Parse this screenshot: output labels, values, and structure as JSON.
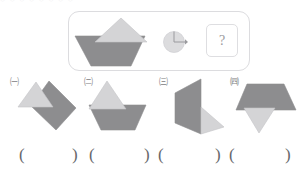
{
  "page": {
    "background_color": "#ffffff",
    "top_ghost_text": "○  ○   ○  ○  ○  ○   ○  ○"
  },
  "palette": {
    "shape_dark": "#8d8d8f",
    "shape_light": "#d4d4d6",
    "shape_mid": "#adadb0",
    "outline": "#9d9da0",
    "panel_border": "#dcdcdf",
    "text": "#6b6b6f"
  },
  "stimulus": {
    "panel_name": "question-panel",
    "source_figure": {
      "name": "source-figure",
      "description": "dark trapezoid with light triangle on its upper right",
      "parts": [
        {
          "shape": "trapezoid",
          "fill": "#8d8d8f"
        },
        {
          "shape": "triangle",
          "fill": "#d4d4d6"
        }
      ]
    },
    "operator": {
      "name": "rotation-dial",
      "description": "circle with quarter-turn arrow indicating 90 degree clockwise rotation",
      "rotation_degrees": 90,
      "direction": "clockwise",
      "dial_fill": "#dcdcde",
      "dial_stroke": "#a9a9ac"
    },
    "unknown": {
      "name": "unknown-box",
      "symbol": "?"
    }
  },
  "options": [
    {
      "id": "option-1",
      "label": "㈠",
      "description": "light triangle at left joined to dark parallelogram angling down-right"
    },
    {
      "id": "option-2",
      "label": "㈡",
      "description": "light triangle on top of dark trapezoid, triangle offset left"
    },
    {
      "id": "option-3",
      "label": "㈢",
      "description": "dark trapezoid rotated 90 degrees standing vertical with light triangle pointing right at base"
    },
    {
      "id": "option-4",
      "label": "㈣",
      "description": "dark trapezoid inverted on top with light triangle pointing down beneath"
    }
  ],
  "answer_slots": [
    {
      "id": "answer-slot-1",
      "open": "(",
      "close": ")",
      "value": ""
    },
    {
      "id": "answer-slot-2",
      "open": "(",
      "close": ")",
      "value": ""
    },
    {
      "id": "answer-slot-3",
      "open": "(",
      "close": ")",
      "value": ""
    },
    {
      "id": "answer-slot-4",
      "open": "(",
      "close": ")",
      "value": ""
    }
  ]
}
